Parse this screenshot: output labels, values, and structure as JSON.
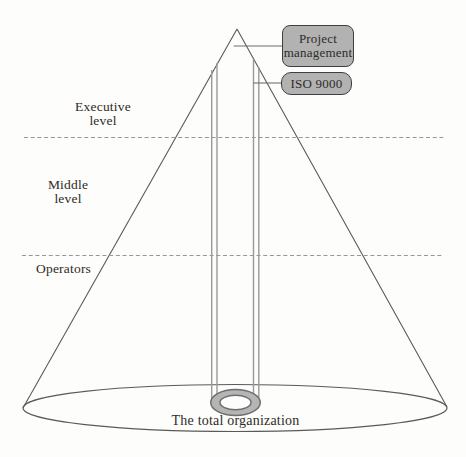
{
  "diagram": {
    "callouts": [
      {
        "id": "project-management",
        "label": "Project management"
      },
      {
        "id": "iso-9000",
        "label": "ISO 9000"
      }
    ],
    "levels": [
      {
        "id": "executive",
        "label": "Executive level"
      },
      {
        "id": "middle",
        "label": "Middle level"
      },
      {
        "id": "operators",
        "label": "Operators"
      }
    ],
    "base_label": "The total organization"
  },
  "colors": {
    "box_fill": "#b2b2b2",
    "box_border": "#3f3f3f",
    "outline": "#5a5a5a",
    "tube_line": "#9a9a9a",
    "dashed_line": "#979797",
    "ring_fill": "#b5b5b5",
    "ring_stroke": "#6e6e6e",
    "text": "#2f2b27",
    "background": "#fdfdfb"
  }
}
